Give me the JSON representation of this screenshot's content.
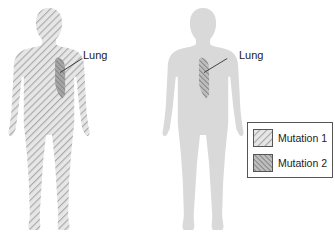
{
  "figures": [
    {
      "id": "left",
      "body_pattern": "mutation-1",
      "organ": "Lung",
      "organ_pattern": "mutation-1-and-2"
    },
    {
      "id": "right",
      "body_pattern": "none",
      "organ": "Lung",
      "organ_pattern": "mutation-2"
    }
  ],
  "labels": {
    "left_lung": "Lung",
    "right_lung": "Lung"
  },
  "legend": {
    "items": [
      {
        "label": "Mutation 1",
        "pattern": "hatch-forward"
      },
      {
        "label": "Mutation 2",
        "pattern": "hatch-backward"
      }
    ]
  },
  "colors": {
    "body_fill": "#d6d6d6",
    "hatch": "#9a9a9a",
    "lung_dark": "#7a7a7a",
    "text": "#222222"
  }
}
